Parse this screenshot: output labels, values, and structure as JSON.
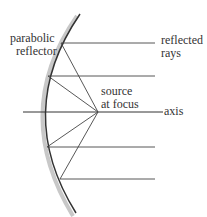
{
  "diagram": {
    "labels": {
      "reflector_line1": "parabolic",
      "reflector_line2": "reflector",
      "rays_line1": "reflected",
      "rays_line2": "rays",
      "source_line1": "source",
      "source_line2": "at focus",
      "axis": "axis"
    },
    "colors": {
      "line": "#333333",
      "shadow": "#c8c8c8"
    },
    "focus": [
      98,
      112
    ],
    "rays": [
      {
        "hit": [
          61,
          43
        ],
        "end_x": 155
      },
      {
        "hit": [
          48,
          76
        ],
        "end_x": 155
      },
      {
        "hit": [
          47,
          147
        ],
        "end_x": 155
      },
      {
        "hit": [
          60,
          179
        ],
        "end_x": 155
      }
    ]
  }
}
